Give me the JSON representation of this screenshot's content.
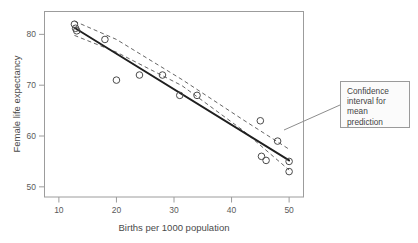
{
  "figure": {
    "title": "",
    "background": "#ffffff"
  },
  "callout": {
    "name": "confidence-interval-callout",
    "lines": [
      "Confidence",
      "interval for",
      "mean",
      "prediction"
    ],
    "text": "Confidence interval for mean prediction",
    "border_color": "#9a9a9a",
    "fill_color": "#fbfbfb",
    "leader_from": [
      340,
      105
    ],
    "leader_to": [
      284,
      130
    ]
  },
  "chart_data": {
    "type": "scatter",
    "title": "",
    "xlabel": "Births per 1000 population",
    "ylabel": "Female life expectancy",
    "xlim": [
      7.5,
      52.5
    ],
    "ylim": [
      48.0,
      84.5
    ],
    "xticks": [
      10,
      20,
      30,
      40,
      50
    ],
    "yticks": [
      50,
      60,
      70,
      80
    ],
    "xtick_labels": [
      "10",
      "20",
      "30",
      "40",
      "50"
    ],
    "ytick_labels": [
      "50",
      "60",
      "70",
      "80"
    ],
    "grid": false,
    "legend": null,
    "frame": "box",
    "marker": "open-circle",
    "marker_color": "#4a4a4a",
    "points": [
      {
        "x": 12.7,
        "y": 82.0
      },
      {
        "x": 12.9,
        "y": 81.2
      },
      {
        "x": 13.1,
        "y": 80.7
      },
      {
        "x": 18.0,
        "y": 79.0
      },
      {
        "x": 20.0,
        "y": 71.0
      },
      {
        "x": 24.0,
        "y": 72.0
      },
      {
        "x": 28.0,
        "y": 72.0
      },
      {
        "x": 31.0,
        "y": 68.0
      },
      {
        "x": 34.0,
        "y": 68.0
      },
      {
        "x": 45.0,
        "y": 63.0
      },
      {
        "x": 45.2,
        "y": 56.0
      },
      {
        "x": 46.0,
        "y": 55.2
      },
      {
        "x": 48.0,
        "y": 59.0
      },
      {
        "x": 50.0,
        "y": 55.0
      },
      {
        "x": 50.0,
        "y": 53.0
      }
    ],
    "series": [
      {
        "name": "Fitted regression line",
        "style": "solid",
        "color": "#222222",
        "x": [
          12.7,
          50.0
        ],
        "y": [
          81.3,
          55.2
        ]
      },
      {
        "name": "Confidence interval upper bound",
        "style": "dashed",
        "color": "#555555",
        "x": [
          12.7,
          20.0,
          31.4,
          42.0,
          50.0
        ],
        "y": [
          82.6,
          79.0,
          71.1,
          63.2,
          57.4
        ]
      },
      {
        "name": "Confidence interval lower bound",
        "style": "dashed",
        "color": "#555555",
        "x": [
          12.7,
          20.0,
          31.4,
          42.0,
          50.0
        ],
        "y": [
          79.8,
          76.5,
          69.9,
          61.1,
          53.3
        ]
      }
    ],
    "annotations": [
      {
        "text": "Confidence interval for mean prediction",
        "points_to_x": 44.6,
        "points_to_y": 60.5
      }
    ]
  }
}
